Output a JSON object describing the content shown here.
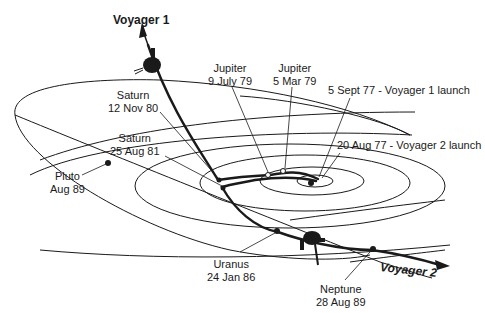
{
  "diagram": {
    "type": "spacecraft-trajectory",
    "spacecraft": [
      {
        "name": "Voyager 1",
        "label": "Voyager 1"
      },
      {
        "name": "Voyager 2",
        "label": "Voyager 2"
      }
    ],
    "launches": [
      {
        "label": "5 Sept 77 - Voyager 1 launch"
      },
      {
        "label": "20 Aug 77 - Voyager 2 launch"
      }
    ],
    "encounters": [
      {
        "planet": "Jupiter",
        "date": "9 July 79"
      },
      {
        "planet": "Jupiter",
        "date": "5 Mar 79"
      },
      {
        "planet": "Saturn",
        "date": "12 Nov 80"
      },
      {
        "planet": "Saturn",
        "date": "25 Aug 81"
      },
      {
        "planet": "Pluto",
        "date": "Aug 89"
      },
      {
        "planet": "Uranus",
        "date": "24 Jan 86"
      },
      {
        "planet": "Neptune",
        "date": "28 Aug 89"
      }
    ]
  },
  "colors": {
    "line": "#1a1a1a",
    "background": "#ffffff"
  }
}
